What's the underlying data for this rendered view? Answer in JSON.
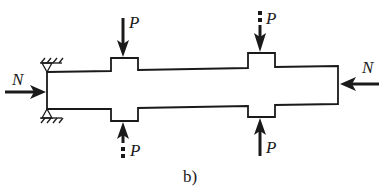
{
  "figure": {
    "caption": "b)",
    "labels": {
      "axial_left": "N",
      "axial_right": "N",
      "force_top_left": "P",
      "force_bottom_left": "P",
      "force_top_right": "P",
      "force_bottom_right": "P"
    },
    "colors": {
      "stroke": "#1a1a1a",
      "background": "#ffffff"
    },
    "elements": {
      "shaft": "stepped shaft with two collars",
      "support_left": "pin supports (hatched) at left end, top and bottom",
      "forces": [
        {
          "id": "top-left",
          "direction": "down",
          "style": "solid arrow",
          "label": "P"
        },
        {
          "id": "bottom-left",
          "direction": "up",
          "style": "dashed-tail arrow",
          "label": "P"
        },
        {
          "id": "top-right",
          "direction": "down",
          "style": "dashed-tail arrow",
          "label": "P"
        },
        {
          "id": "bottom-right",
          "direction": "up",
          "style": "solid arrow",
          "label": "P"
        },
        {
          "id": "axial-left",
          "direction": "right",
          "style": "solid arrow",
          "label": "N"
        },
        {
          "id": "axial-right",
          "direction": "left",
          "style": "solid arrow",
          "label": "N"
        }
      ]
    }
  }
}
